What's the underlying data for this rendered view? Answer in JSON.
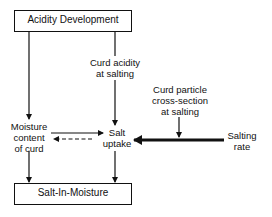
{
  "diagram": {
    "nodes": {
      "acidity_development": "Acidity Development",
      "curd_acidity_line1": "Curd acidity",
      "curd_acidity_line2": "at salting",
      "curd_particle_line1": "Curd particle",
      "curd_particle_line2": "cross-section",
      "curd_particle_line3": "at salting",
      "moisture_line1": "Moisture",
      "moisture_line2": "content",
      "moisture_line3": "of curd",
      "salt_uptake_line1": "Salt",
      "salt_uptake_line2": "uptake",
      "salting_rate_line1": "Salting",
      "salting_rate_line2": "rate",
      "salt_in_moisture": "Salt-In-Moisture"
    },
    "edges": [
      {
        "from": "Acidity Development",
        "to": "Moisture content of curd",
        "style": "solid"
      },
      {
        "from": "Acidity Development",
        "to": "Salt uptake",
        "via": "Curd acidity at salting",
        "style": "solid"
      },
      {
        "from": "Curd particle cross-section at salting",
        "to": "Salting rate → Salt uptake",
        "style": "solid"
      },
      {
        "from": "Salting rate",
        "to": "Salt uptake",
        "style": "thick"
      },
      {
        "from": "Moisture content of curd",
        "to": "Salt uptake",
        "style": "solid"
      },
      {
        "from": "Salt uptake",
        "to": "Moisture content of curd",
        "style": "dashed"
      },
      {
        "from": "Moisture content of curd",
        "to": "Salt-In-Moisture",
        "style": "solid"
      },
      {
        "from": "Salt uptake",
        "to": "Salt-In-Moisture",
        "style": "solid"
      }
    ]
  }
}
